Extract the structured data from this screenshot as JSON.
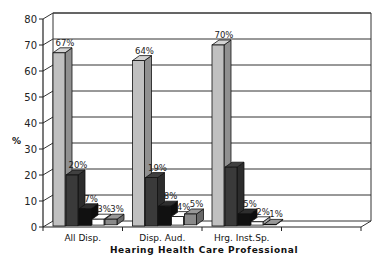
{
  "chart_data": {
    "type": "bar",
    "style": "3d-clustered-column",
    "title": "",
    "xlabel": "Hearing Health Care Professional",
    "ylabel": "%",
    "ylim": [
      0,
      80
    ],
    "yticks": [
      0,
      10,
      20,
      30,
      40,
      50,
      60,
      70,
      80
    ],
    "grid": true,
    "legend": "none",
    "categories": [
      "All Disp.",
      "Disp. Aud.",
      "Hrg. Inst.Sp.",
      ""
    ],
    "series": [
      {
        "name": "Series 1",
        "color": "#c0c0c0",
        "values": [
          67,
          64,
          70,
          null
        ],
        "labels": [
          "67%",
          "64%",
          "70%",
          ""
        ]
      },
      {
        "name": "Series 2",
        "color": "#3a3a3a",
        "values": [
          20,
          19,
          23,
          null
        ],
        "labels": [
          "20%",
          "19%",
          "",
          ""
        ]
      },
      {
        "name": "Series 3",
        "color": "#111111",
        "values": [
          7,
          8,
          5,
          null
        ],
        "labels": [
          "7%",
          "8%",
          "5%",
          ""
        ]
      },
      {
        "name": "Series 4",
        "color": "#ffffff",
        "values": [
          3,
          4,
          2,
          null
        ],
        "labels": [
          "3%",
          "4%",
          "2%",
          ""
        ]
      },
      {
        "name": "Series 5",
        "color": "#8a8a8a",
        "values": [
          3,
          5,
          1,
          null
        ],
        "labels": [
          "3%",
          "5%",
          "1%",
          ""
        ]
      }
    ]
  }
}
